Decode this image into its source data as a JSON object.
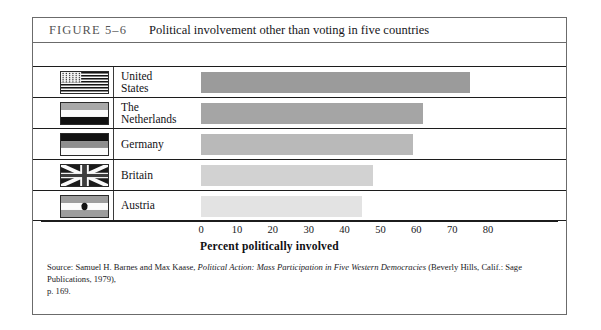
{
  "figure": {
    "number": "FIGURE 5–6",
    "title": "Political involvement other than voting in five countries"
  },
  "chart_data": {
    "type": "bar",
    "orientation": "horizontal",
    "title": "Political involvement other than voting in five countries",
    "xlabel": "Percent politically involved",
    "ylabel": "",
    "categories": [
      "United States",
      "The Netherlands",
      "Germany",
      "Britain",
      "Austria"
    ],
    "values": [
      75,
      62,
      59,
      48,
      45
    ],
    "xlim": [
      0,
      80
    ],
    "xticks": [
      0,
      10,
      20,
      30,
      40,
      50,
      60,
      70,
      80
    ],
    "xtick_labels": [
      "0",
      "10",
      "20",
      "30",
      "40",
      "50",
      "60",
      "70",
      "80"
    ],
    "grid": false,
    "legend": "none",
    "bar_colors": [
      "#9b9b9b",
      "#a5a5a5",
      "#b9b9b9",
      "#d2d2d2",
      "#e3e3e3"
    ]
  },
  "rows": [
    {
      "country_line1": "United",
      "country_line2": "States",
      "flag": "flag-united-states",
      "value": 75
    },
    {
      "country_line1": "The",
      "country_line2": "Netherlands",
      "flag": "flag-netherlands",
      "value": 62
    },
    {
      "country_line1": "Germany",
      "country_line2": "",
      "flag": "flag-germany",
      "value": 59
    },
    {
      "country_line1": "Britain",
      "country_line2": "",
      "flag": "flag-britain",
      "value": 48
    },
    {
      "country_line1": "Austria",
      "country_line2": "",
      "flag": "flag-austria",
      "value": 45
    }
  ],
  "source": {
    "prefix": "Source: Samuel H. Barnes and Max Kaase, ",
    "italic_title": "Political Action: Mass Participation in Five Western Democracies",
    "suffix": " (Beverly Hills, Calif.: Sage Publications, 1979),",
    "page": "p. 169."
  }
}
